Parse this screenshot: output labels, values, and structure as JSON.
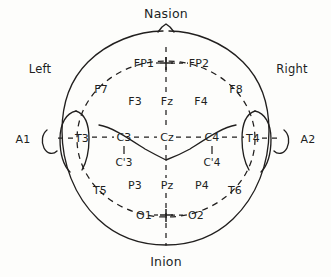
{
  "figure": {
    "ink_color": "#211f1e",
    "background_color": "#fdfdfb"
  },
  "landmarks": {
    "nasion": "Nasion",
    "inion": "Inion"
  },
  "sides": {
    "left": "Left",
    "right": "Right"
  },
  "ear_references": {
    "left_ear": "A1",
    "right_ear": "A2"
  },
  "electrodes": {
    "prefrontal": [
      {
        "id": "fp1",
        "label": "FP1",
        "x": 144,
        "y": 63
      },
      {
        "id": "fp2",
        "label": "FP2",
        "x": 199,
        "y": 63
      }
    ],
    "frontal": [
      {
        "id": "f7",
        "label": "F7",
        "x": 101,
        "y": 89
      },
      {
        "id": "f3",
        "label": "F3",
        "x": 135,
        "y": 101
      },
      {
        "id": "fz",
        "label": "Fz",
        "x": 167,
        "y": 101
      },
      {
        "id": "f4",
        "label": "F4",
        "x": 201,
        "y": 101
      },
      {
        "id": "f8",
        "label": "F8",
        "x": 236,
        "y": 89
      }
    ],
    "central": [
      {
        "id": "t3",
        "label": "T3",
        "x": 82,
        "y": 138
      },
      {
        "id": "c3",
        "label": "C3",
        "x": 124,
        "y": 137
      },
      {
        "id": "cz",
        "label": "Cz",
        "x": 167,
        "y": 137
      },
      {
        "id": "c4",
        "label": "C4",
        "x": 212,
        "y": 137
      },
      {
        "id": "t4",
        "label": "T4",
        "x": 253,
        "y": 138
      }
    ],
    "central_prime": [
      {
        "id": "c3p",
        "label": "C'3",
        "x": 124,
        "y": 162
      },
      {
        "id": "c4p",
        "label": "C'4",
        "x": 212,
        "y": 162
      }
    ],
    "parietal": [
      {
        "id": "t5",
        "label": "T5",
        "x": 100,
        "y": 190
      },
      {
        "id": "p3",
        "label": "P3",
        "x": 135,
        "y": 185
      },
      {
        "id": "pz",
        "label": "Pz",
        "x": 167,
        "y": 185
      },
      {
        "id": "p4",
        "label": "P4",
        "x": 202,
        "y": 185
      },
      {
        "id": "t6",
        "label": "T6",
        "x": 235,
        "y": 190
      }
    ],
    "occipital": [
      {
        "id": "o1",
        "label": "O1",
        "x": 144,
        "y": 214
      },
      {
        "id": "o2",
        "label": "O2",
        "x": 196,
        "y": 214
      }
    ]
  },
  "markers": {
    "frontal_midline_cross": "+",
    "occipital_midline_cross": "+"
  }
}
